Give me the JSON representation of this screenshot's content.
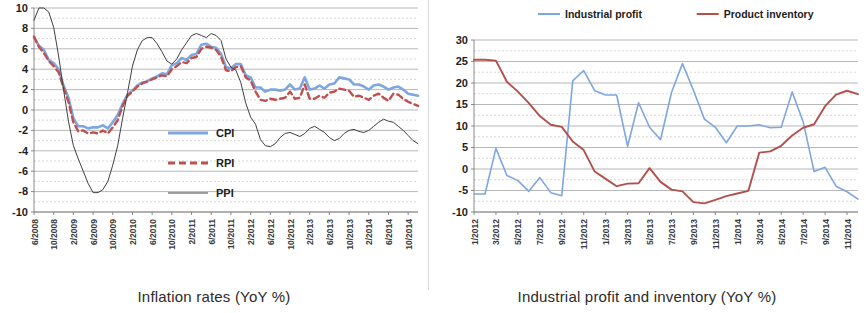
{
  "figure": {
    "left_caption": "Inflation rates (YoY %)",
    "right_caption": "Industrial profit and inventory (YoY %)"
  },
  "colors": {
    "cpi": "#7EA6E0",
    "rpi": "#C0504D",
    "ppi": "#404040",
    "industrial_profit": "#7EA6E0",
    "product_inventory": "#B2504B",
    "grid": "#9a9a9a",
    "axis": "#7d7d7d",
    "text": "#1d1d1d"
  },
  "chart_data": [
    {
      "id": "inflation",
      "type": "line",
      "title": "Inflation rates (YoY %)",
      "xlabel": "",
      "ylabel": "",
      "ylim": [
        -10,
        10
      ],
      "ytick_values": [
        10,
        8,
        6,
        4,
        2,
        0,
        -2,
        -4,
        -6,
        -8,
        -10
      ],
      "ytick_labels": [
        "10",
        "8",
        "6",
        "4",
        "2",
        "0",
        "-2",
        "-4",
        "-6",
        "-8",
        "-10"
      ],
      "grid": true,
      "legend_position": "inside-center-lower",
      "xtick_labels": [
        "6/2008",
        "10/2008",
        "2/2009",
        "6/2009",
        "10/2009",
        "2/2010",
        "6/2010",
        "10/2010",
        "2/2011",
        "6/2011",
        "10/2011",
        "2/2012",
        "6/2012",
        "10/2012",
        "2/2013",
        "6/2013",
        "10/2013",
        "2/2014",
        "6/2014",
        "10/2014"
      ],
      "x_start": "6/2008",
      "x_end": "12/2014",
      "x_step_months": 1,
      "xtick_step_months": 4,
      "series": [
        {
          "name": "CPI",
          "style": "solid",
          "color": "#7EA6E0",
          "width": 2.6,
          "values": [
            7.1,
            6.3,
            5.9,
            4.9,
            4.6,
            4.0,
            2.4,
            1.2,
            -0.8,
            -1.6,
            -1.6,
            -1.8,
            -1.7,
            -1.7,
            -1.5,
            -1.8,
            -1.2,
            -0.5,
            0.6,
            1.5,
            1.9,
            2.4,
            2.7,
            2.8,
            3.1,
            3.3,
            3.6,
            3.5,
            4.4,
            4.6,
            5.1,
            4.9,
            5.4,
            5.5,
            6.4,
            6.5,
            6.2,
            6.1,
            5.5,
            4.2,
            4.1,
            4.5,
            4.5,
            3.4,
            3.2,
            2.2,
            2.2,
            1.8,
            2.0,
            2.0,
            1.9,
            2.0,
            2.5,
            2.0,
            2.1,
            3.2,
            2.0,
            2.1,
            2.4,
            2.1,
            2.5,
            2.6,
            3.2,
            3.1,
            3.0,
            2.5,
            2.5,
            2.3,
            2.0,
            2.4,
            2.5,
            2.3,
            2.0,
            2.2,
            2.3,
            2.0,
            1.6,
            1.5,
            1.4
          ]
        },
        {
          "name": "RPI",
          "style": "dashed",
          "color": "#C0504D",
          "width": 2.4,
          "values": [
            7.2,
            6.2,
            5.6,
            4.8,
            4.3,
            3.7,
            2.2,
            0.8,
            -1.2,
            -2.1,
            -2.0,
            -2.3,
            -2.2,
            -2.3,
            -2.0,
            -2.3,
            -1.7,
            -1.0,
            0.4,
            1.4,
            1.8,
            2.3,
            2.6,
            2.8,
            3.0,
            3.2,
            3.4,
            3.3,
            4.0,
            4.3,
            4.7,
            4.6,
            5.1,
            5.2,
            6.0,
            6.2,
            6.1,
            5.9,
            5.2,
            3.9,
            3.8,
            4.2,
            4.3,
            3.2,
            2.9,
            1.8,
            1.0,
            0.9,
            1.1,
            1.0,
            1.1,
            1.2,
            1.8,
            1.1,
            1.2,
            2.5,
            1.1,
            1.1,
            1.4,
            1.2,
            1.7,
            1.8,
            2.1,
            2.0,
            1.9,
            1.3,
            1.4,
            1.2,
            1.0,
            1.4,
            1.6,
            1.2,
            0.9,
            1.6,
            1.5,
            1.1,
            0.8,
            0.6,
            0.4
          ]
        },
        {
          "name": "PPI",
          "style": "thin-solid",
          "color": "#404040",
          "width": 1.0,
          "values": [
            8.8,
            10.0,
            10.0,
            9.6,
            8.1,
            5.3,
            2.0,
            -1.1,
            -3.5,
            -4.8,
            -6.0,
            -7.2,
            -8.1,
            -8.1,
            -7.8,
            -7.0,
            -5.4,
            -3.5,
            -0.8,
            1.7,
            4.3,
            5.9,
            6.8,
            7.1,
            7.1,
            6.5,
            5.7,
            4.8,
            4.5,
            5.0,
            5.9,
            6.6,
            7.3,
            7.5,
            7.3,
            7.1,
            7.5,
            7.3,
            6.8,
            5.0,
            4.2,
            3.9,
            2.7,
            0.7,
            -0.7,
            -1.4,
            -2.9,
            -3.5,
            -3.6,
            -3.3,
            -2.7,
            -2.3,
            -2.2,
            -2.4,
            -2.6,
            -2.3,
            -1.8,
            -1.6,
            -1.9,
            -2.2,
            -2.7,
            -3.0,
            -2.8,
            -2.3,
            -2.0,
            -1.9,
            -2.1,
            -2.2,
            -2.0,
            -1.6,
            -1.2,
            -0.9,
            -1.1,
            -1.2,
            -1.6,
            -2.0,
            -2.5,
            -3.0,
            -3.3
          ]
        }
      ],
      "legend": [
        {
          "label": "CPI",
          "color": "#7EA6E0",
          "style": "solid"
        },
        {
          "label": "RPI",
          "color": "#C0504D",
          "style": "dashed"
        },
        {
          "label": "PPI",
          "color": "#404040",
          "style": "thin-solid"
        }
      ]
    },
    {
      "id": "industrial",
      "type": "line",
      "title": "Industrial profit and inventory (YoY %)",
      "xlabel": "",
      "ylabel": "",
      "ylim": [
        -10,
        30
      ],
      "ytick_values": [
        30,
        25,
        20,
        15,
        10,
        5,
        0,
        -5,
        -10
      ],
      "ytick_labels": [
        "30",
        "25",
        "20",
        "15",
        "10",
        "5",
        "0",
        "-5",
        "-10"
      ],
      "grid": true,
      "legend_position": "top-center",
      "xtick_labels": [
        "1/2012",
        "3/2012",
        "5/2012",
        "7/2012",
        "9/2012",
        "11/2012",
        "1/2013",
        "3/2013",
        "5/2013",
        "7/2013",
        "9/2013",
        "11/2013",
        "1/2014",
        "3/2014",
        "5/2014",
        "7/2014",
        "9/2014",
        "11/2014"
      ],
      "x_start": "1/2012",
      "x_end": "12/2014",
      "x_step_months": 1,
      "xtick_step_months": 2,
      "series": [
        {
          "name": "Industrial profit",
          "style": "solid",
          "color": "#7EA6E0",
          "width": 1.6,
          "values": [
            -5.8,
            -5.8,
            4.8,
            -1.5,
            -2.7,
            -5.2,
            -2.0,
            -5.5,
            -6.2,
            20.5,
            22.9,
            18.2,
            17.2,
            17.2,
            5.3,
            15.4,
            9.7,
            6.8,
            17.8,
            24.5,
            18.3,
            11.6,
            9.7,
            6.1,
            10.0,
            10.0,
            10.3,
            9.6,
            9.7,
            17.9,
            11.0,
            -0.6,
            0.4,
            -4.0,
            -5.3,
            -7.0
          ]
        },
        {
          "name": "Product inventory",
          "style": "solid",
          "color": "#B2504B",
          "width": 1.9,
          "values": [
            25.4,
            25.4,
            25.2,
            20.3,
            18.0,
            15.3,
            12.3,
            10.3,
            9.8,
            6.4,
            4.4,
            -0.6,
            -2.3,
            -4.0,
            -3.4,
            -3.3,
            0.2,
            -3.0,
            -4.8,
            -5.2,
            -7.7,
            -8.0,
            -7.2,
            -6.3,
            -5.7,
            -5.1,
            3.8,
            4.1,
            5.4,
            7.8,
            9.6,
            10.4,
            14.6,
            17.3,
            18.2,
            17.4
          ]
        }
      ],
      "legend": [
        {
          "label": "Industrial profit",
          "color": "#7EA6E0",
          "style": "solid"
        },
        {
          "label": "Product inventory",
          "color": "#B2504B",
          "style": "solid"
        }
      ]
    }
  ]
}
